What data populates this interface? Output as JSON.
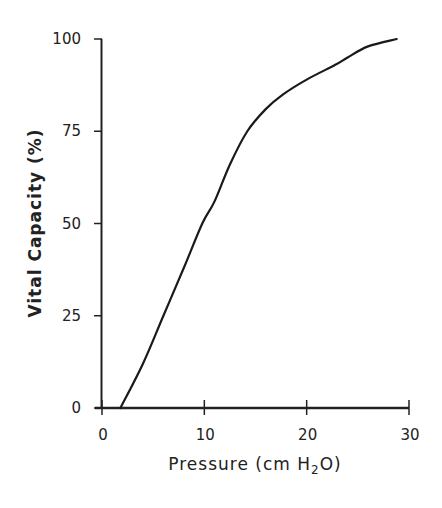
{
  "chart_data": {
    "type": "line",
    "title": "",
    "xlabel": "Pressure (cm H2O)",
    "xlabel_parts": {
      "pre": "Pressure (cm H",
      "sub": "2",
      "post": "O)"
    },
    "ylabel": "Vital Capacity (%)",
    "xlim": [
      0,
      30
    ],
    "ylim": [
      0,
      100
    ],
    "xticks": [
      "0",
      "10",
      "20",
      "30"
    ],
    "yticks": [
      "0",
      "25",
      "50",
      "75",
      "100"
    ],
    "grid": false,
    "legend": null,
    "series": [
      {
        "name": "Pressure-volume curve",
        "x": [
          1.8,
          4,
          6,
          8,
          9.8,
          11,
          12.5,
          14.2,
          16,
          17.7,
          20,
          22.8,
          24,
          26,
          28.8
        ],
        "y": [
          0,
          12,
          25,
          38,
          50,
          56,
          66,
          75,
          81,
          85,
          89,
          93,
          95,
          98,
          100
        ]
      }
    ]
  }
}
